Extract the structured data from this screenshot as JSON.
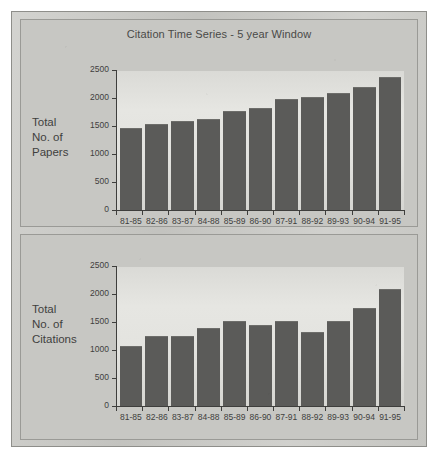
{
  "figure": {
    "title": "Citation Time Series - 5 year Window",
    "colors": {
      "bar": "#5b5b59",
      "plot_background": "#e3e3df",
      "page_background": "#c9c9c5",
      "axis": "#3e3e3c",
      "text": "#3f3f3e"
    }
  },
  "panels": [
    {
      "row_label_lines": [
        "Total",
        "No. of",
        "Papers"
      ],
      "ytick_labels": [
        "2500",
        "2000",
        "1500",
        "1000",
        "500",
        "0"
      ]
    },
    {
      "row_label_lines": [
        "Total",
        "No. of",
        "Citations"
      ],
      "ytick_labels": [
        "2500",
        "2000",
        "1500",
        "1000",
        "500",
        "0"
      ]
    }
  ],
  "chart_data": [
    {
      "type": "bar",
      "title": "Citation Time Series - 5 year Window",
      "xlabel": "",
      "ylabel": "Total No. of Papers",
      "ylim": [
        0,
        2500
      ],
      "yticks": [
        0,
        500,
        1000,
        1500,
        2000,
        2500
      ],
      "grid": false,
      "legend": false,
      "categories": [
        "81-85",
        "82-86",
        "83-87",
        "84-88",
        "85-89",
        "86-90",
        "87-91",
        "88-92",
        "89-93",
        "90-94",
        "91-95"
      ],
      "values": [
        1470,
        1540,
        1590,
        1620,
        1760,
        1825,
        1985,
        2010,
        2090,
        2195,
        2380
      ]
    },
    {
      "type": "bar",
      "title": "",
      "xlabel": "",
      "ylabel": "Total No. of Citations",
      "ylim": [
        0,
        2500
      ],
      "yticks": [
        0,
        500,
        1000,
        1500,
        2000,
        2500
      ],
      "grid": false,
      "legend": false,
      "categories": [
        "81-85",
        "82-86",
        "83-87",
        "84-88",
        "85-89",
        "86-90",
        "87-91",
        "88-92",
        "89-93",
        "90-94",
        "91-95"
      ],
      "values": [
        1080,
        1245,
        1245,
        1390,
        1510,
        1450,
        1510,
        1330,
        1510,
        1750,
        2085
      ]
    }
  ]
}
